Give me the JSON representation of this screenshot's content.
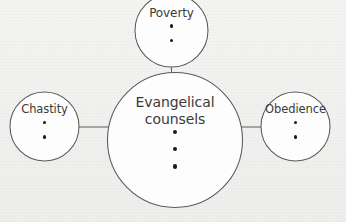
{
  "diagram": {
    "type": "mind-map",
    "background_color": "#f1f1f0",
    "stroke_color": "#5a5a5a",
    "text_color": "#3a3a3a",
    "dot_color": "#1a1a1a",
    "center": {
      "label_line_1": "Evangelical",
      "label_line_2": "counsels",
      "bullet_count": 3,
      "bullets": [
        "",
        "",
        ""
      ]
    },
    "branches": [
      {
        "id": "poverty",
        "label": "Poverty",
        "position": "top",
        "bullet_count": 2,
        "bullets": [
          "",
          ""
        ]
      },
      {
        "id": "chastity",
        "label": "Chastity",
        "position": "left",
        "bullet_count": 2,
        "bullets": [
          "",
          ""
        ]
      },
      {
        "id": "obedience",
        "label": "Obedience",
        "position": "right",
        "bullet_count": 2,
        "bullets": [
          "",
          ""
        ]
      }
    ],
    "connectors": [
      {
        "id": "center-to-poverty",
        "from": "center",
        "to": "poverty"
      },
      {
        "id": "center-to-chastity",
        "from": "center",
        "to": "chastity"
      },
      {
        "id": "center-to-obedience",
        "from": "center",
        "to": "obedience"
      }
    ]
  }
}
